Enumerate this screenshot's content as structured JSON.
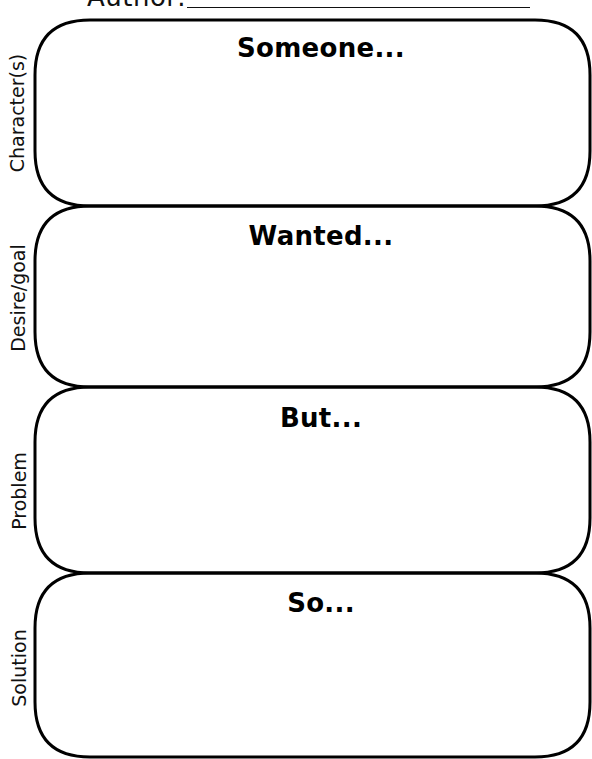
{
  "header": {
    "author_label": "Author:",
    "author_value": ""
  },
  "sections": [
    {
      "side_label": "Character(s)",
      "heading": "Someone...",
      "answer": ""
    },
    {
      "side_label": "Desire/goal",
      "heading": "Wanted...",
      "answer": ""
    },
    {
      "side_label": "Problem",
      "heading": "But...",
      "answer": ""
    },
    {
      "side_label": "Solution",
      "heading": "So...",
      "answer": ""
    }
  ],
  "colors": {
    "ink": "#000000",
    "background": "#ffffff"
  }
}
